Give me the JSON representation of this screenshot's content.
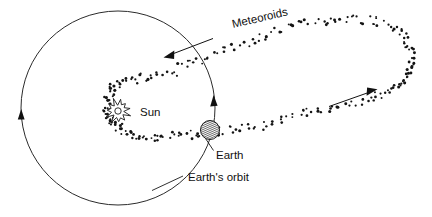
{
  "figure": {
    "title_visible": false,
    "background_color": "#ffffff",
    "ink_color": "#111111",
    "width": 432,
    "height": 217
  },
  "labels": {
    "sun": "Sun",
    "earth": "Earth",
    "meteoroids": "Meteoroids",
    "earths_orbit": "Earth's orbit"
  },
  "objects": {
    "sun": {
      "name": "Sun",
      "icon": "sunburst-icon",
      "center_x": 118,
      "center_y": 111,
      "ray_count": 11,
      "outer_radius": 12,
      "inner_radius": 6.5,
      "core_radius": 3.2
    },
    "earth": {
      "name": "Earth",
      "icon": "earth-hatched-circle-icon",
      "center_x": 210,
      "center_y": 130,
      "radius": 9.5,
      "hatched": true
    },
    "earth_orbit": {
      "name": "Earth's orbit",
      "shape": "circle",
      "center_x": 118,
      "center_y": 108,
      "radius": 97,
      "direction_arrows": 2
    },
    "meteoroid_stream": {
      "name": "Meteoroids",
      "shape": "elongated-loop",
      "dot_count": 186,
      "direction_arrows": 2
    }
  },
  "annotations": {
    "meteoroid_arrow_left": {
      "name": "meteoroid-direction-arrow-inbound",
      "from_x": 212,
      "from_y": 39,
      "to_x": 166,
      "to_y": 56,
      "points": "toward-sun"
    },
    "meteoroid_arrow_right": {
      "name": "meteoroid-direction-arrow-outbound",
      "from_x": 329,
      "from_y": 106,
      "to_x": 375,
      "to_y": 90,
      "points": "away-from-sun"
    },
    "orbit_arrow_left": {
      "name": "earth-orbit-direction-arrow-left",
      "at_x": 21,
      "at_y": 115,
      "points": "down"
    },
    "orbit_arrow_right": {
      "name": "earth-orbit-direction-arrow-right",
      "at_x": 213,
      "at_y": 100,
      "points": "up"
    },
    "earth_leader": {
      "name": "earth-label-leader-line",
      "from_x": 206,
      "from_y": 139,
      "to_x": 213,
      "to_y": 150
    },
    "orbit_leader": {
      "name": "earths-orbit-label-leader-line",
      "from_x": 152,
      "from_y": 190,
      "to_x": 182,
      "to_y": 176
    },
    "meteoroids_leader": {
      "name": "meteoroids-label-leader",
      "rotation_deg": -13
    }
  },
  "text_positions": {
    "sun": {
      "x": 140,
      "y": 116
    },
    "earth": {
      "x": 216,
      "y": 158
    },
    "meteoroids": {
      "x": 233,
      "y": 28,
      "rotation_deg": -13
    },
    "earths_orbit": {
      "x": 188,
      "y": 180
    }
  }
}
